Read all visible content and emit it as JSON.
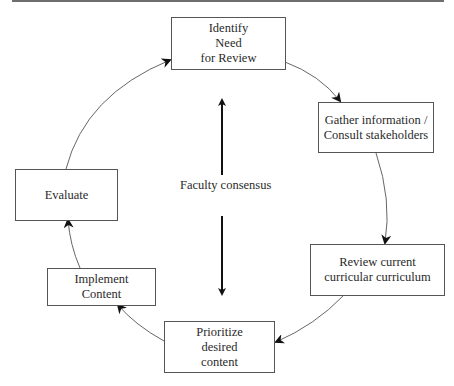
{
  "diagram": {
    "type": "cycle",
    "center_label": "Faculty consensus",
    "nodes": [
      {
        "id": "identify",
        "lines": [
          "Identify",
          "Need",
          "for Review"
        ]
      },
      {
        "id": "gather",
        "lines": [
          "Gather information  /",
          "Consult stakeholders"
        ]
      },
      {
        "id": "review",
        "lines": [
          "Review current",
          "curricular curriculum"
        ]
      },
      {
        "id": "prioritize",
        "lines": [
          "Prioritize",
          "desired",
          "content"
        ]
      },
      {
        "id": "implement",
        "lines": [
          "Implement",
          "Content"
        ]
      },
      {
        "id": "evaluate",
        "lines": [
          "Evaluate"
        ]
      }
    ],
    "edges": [
      {
        "from": "identify",
        "to": "gather"
      },
      {
        "from": "gather",
        "to": "review"
      },
      {
        "from": "review",
        "to": "prioritize"
      },
      {
        "from": "prioritize",
        "to": "implement"
      },
      {
        "from": "implement",
        "to": "evaluate"
      },
      {
        "from": "evaluate",
        "to": "identify"
      }
    ],
    "colors": {
      "line": "#555555",
      "arrowhead": "#111111",
      "topbar": "#6e6e6e"
    }
  }
}
